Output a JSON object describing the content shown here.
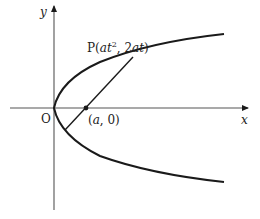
{
  "diagram": {
    "type": "parabola-focal-chord",
    "colors": {
      "curve": "#1a1a1a",
      "axis": "#555555",
      "text": "#222222"
    },
    "axes": {
      "x_label": "x",
      "y_label": "y",
      "origin_label": "O"
    },
    "labels": {
      "point_p_prefix": "P(",
      "point_p_x_a": "at",
      "point_p_x_exp": "2",
      "point_p_sep": ", 2",
      "point_p_y": "at",
      "point_p_suffix": ")",
      "focus_prefix": "(",
      "focus_a": "a",
      "focus_suffix": ", 0)"
    }
  }
}
